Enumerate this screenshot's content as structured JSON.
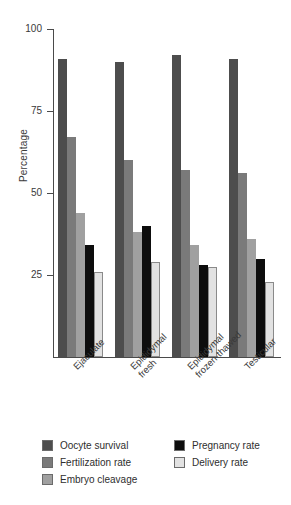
{
  "chart_data": {
    "type": "bar",
    "title": "",
    "xlabel": "",
    "ylabel": "Percentage",
    "ylim": [
      0,
      100
    ],
    "yticks": [
      100,
      75,
      50,
      25
    ],
    "ytick_labels": [
      "100",
      "75",
      "50",
      "25"
    ],
    "grid": false,
    "legend_position": "below-axes",
    "categories": [
      "Ejaculate",
      "Epididymal\nfresh",
      "Epididymal\nfrozen-thawed",
      "Testicular"
    ],
    "series": [
      {
        "name": "Oocyte survival",
        "color": "#4d4d4d",
        "values": [
          91,
          90,
          92,
          91
        ]
      },
      {
        "name": "Fertilization rate",
        "color": "#7a7a7a",
        "values": [
          67,
          60,
          57,
          56
        ]
      },
      {
        "name": "Embryo cleavage",
        "color": "#a0a0a0",
        "values": [
          44,
          38,
          34,
          36
        ]
      },
      {
        "name": "Pregnancy rate",
        "color": "#0d0d0d",
        "values": [
          34,
          40,
          28,
          30
        ]
      },
      {
        "name": "Delivery rate",
        "color": "#e2e2e2",
        "values": [
          26,
          29,
          27.5,
          23
        ]
      }
    ]
  },
  "legend": {
    "columns": [
      [
        "Oocyte survival",
        "Fertilization rate",
        "Embryo cleavage"
      ],
      [
        "Pregnancy rate",
        "Delivery rate"
      ]
    ]
  }
}
